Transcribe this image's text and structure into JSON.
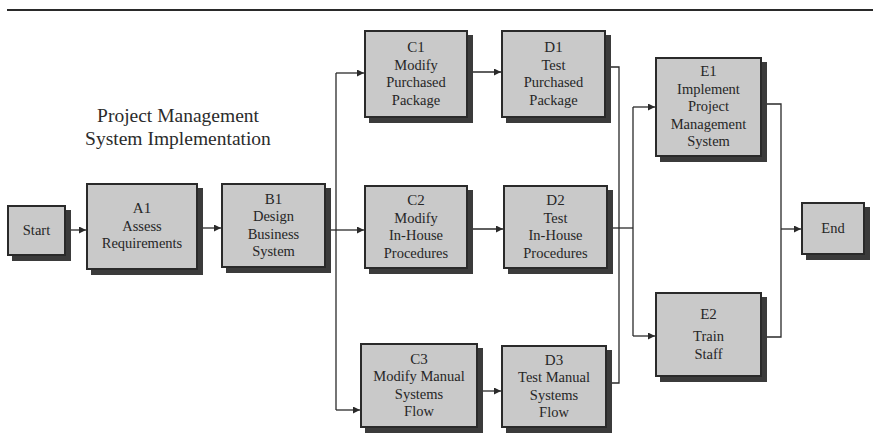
{
  "title": {
    "line1": "Project  Management",
    "line2": "System Implementation"
  },
  "nodes": {
    "start": {
      "label": "Start"
    },
    "a1": {
      "id": "A1",
      "line1": "Assess",
      "line2": "Requirements"
    },
    "b1": {
      "id": "B1",
      "line1": "Design",
      "line2": "Business",
      "line3": "System"
    },
    "c1": {
      "id": "C1",
      "line1": "Modify",
      "line2": "Purchased",
      "line3": "Package"
    },
    "c2": {
      "id": "C2",
      "line1": "Modify",
      "line2": "In-House",
      "line3": "Procedures"
    },
    "c3": {
      "id": "C3",
      "line1": "Modify Manual",
      "line2": "Systems",
      "line3": "Flow"
    },
    "d1": {
      "id": "D1",
      "line1": "Test",
      "line2": "Purchased",
      "line3": "Package"
    },
    "d2": {
      "id": "D2",
      "line1": "Test",
      "line2": "In-House",
      "line3": "Procedures"
    },
    "d3": {
      "id": "D3",
      "line1": "Test Manual",
      "line2": "Systems",
      "line3": "Flow"
    },
    "e1": {
      "id": "E1",
      "line1": "Implement",
      "line2": "Project",
      "line3": "Management",
      "line4": "System"
    },
    "e2": {
      "id": "E2",
      "line1": "Train",
      "line2": "Staff"
    },
    "end": {
      "label": "End"
    }
  },
  "edges": [
    [
      "Start",
      "A1"
    ],
    [
      "A1",
      "B1"
    ],
    [
      "B1",
      "C1"
    ],
    [
      "B1",
      "C2"
    ],
    [
      "B1",
      "C3"
    ],
    [
      "C1",
      "D1"
    ],
    [
      "C2",
      "D2"
    ],
    [
      "C3",
      "D3"
    ],
    [
      "D1",
      "E1"
    ],
    [
      "D2",
      "E1"
    ],
    [
      "D3",
      "E1"
    ],
    [
      "D1",
      "E2"
    ],
    [
      "D2",
      "E2"
    ],
    [
      "D3",
      "E2"
    ],
    [
      "E1",
      "End"
    ],
    [
      "E2",
      "End"
    ]
  ],
  "colors": {
    "box_fill": "#c9c9c9",
    "box_border": "#2a2a2a",
    "shadow": "#3b3b3b",
    "line": "#2a2a2a"
  }
}
